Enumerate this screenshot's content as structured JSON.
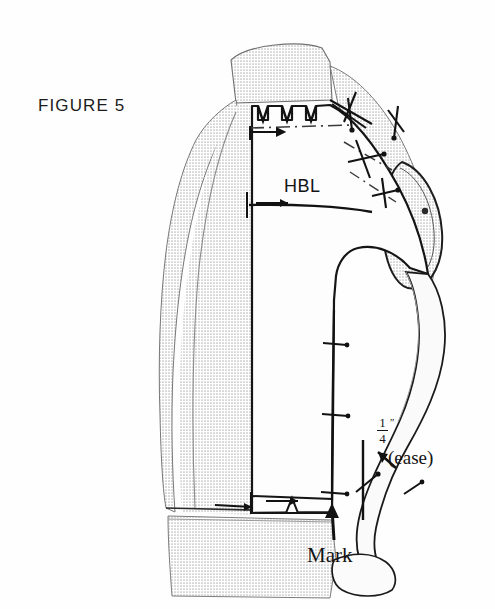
{
  "figure": {
    "title": "FIGURE 5"
  },
  "annotations": {
    "hbl": "HBL",
    "mark": "Mark",
    "ease_numerator": "1",
    "ease_denominator": "4",
    "ease_inch_symbol": "″",
    "ease_note": "(ease)"
  },
  "colors": {
    "ink": "#141414",
    "form_shade": "#d9d9d9",
    "form_shade_light": "#e6e6e6",
    "fabric": "#fdfdfd",
    "paper": "#ffffff"
  },
  "diagram_elements": {
    "neck_clips_count": 3,
    "shoulder_pins_count": 4,
    "center_front_pins_count": 3,
    "dart_tick_count": 3,
    "waist_notch_count": 1,
    "ease_arrow_direction": "up-left",
    "mark_arrow_direction": "up",
    "hbl_arrow_direction": "right"
  }
}
